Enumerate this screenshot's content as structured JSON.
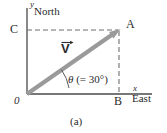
{
  "figure": {
    "caption": "(a)",
    "axes": {
      "y_label": "y",
      "x_label": "x",
      "y_direction_label": "North",
      "x_direction_label": "East"
    },
    "points": {
      "origin_label": "0",
      "point_a_label": "A",
      "point_b_label": "B",
      "point_c_label": "C"
    },
    "vector": {
      "label": "V",
      "notation": "arrow-overbar"
    },
    "angle": {
      "symbol": "θ",
      "value_text": "(= 30°)",
      "degrees": 30
    },
    "colors": {
      "vector": "#9a9a9a",
      "axis": "#4a4a4a",
      "dashed": "#6f6f6f",
      "text": "#2b2b2b",
      "background": "#ffffff"
    },
    "geometry": {
      "origin": [
        27,
        94
      ],
      "point_a": [
        119,
        30
      ],
      "point_b": [
        119,
        94
      ],
      "point_c": [
        27,
        30
      ]
    }
  }
}
